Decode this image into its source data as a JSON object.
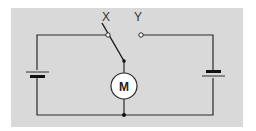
{
  "diagram": {
    "type": "circuit",
    "background_color": "#d9d9d9",
    "wire_color": "#2a2a2a",
    "labels": {
      "terminal_x": "X",
      "terminal_y": "Y",
      "motor": "M"
    },
    "components": [
      {
        "id": "battery-left",
        "kind": "battery"
      },
      {
        "id": "battery-right",
        "kind": "battery"
      },
      {
        "id": "switch",
        "kind": "two-way switch",
        "connected_to": "X"
      },
      {
        "id": "motor",
        "kind": "motor",
        "label": "M"
      }
    ]
  }
}
